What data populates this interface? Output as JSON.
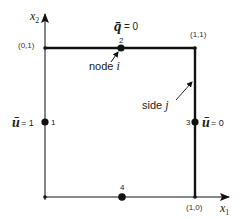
{
  "diagram": {
    "type": "unit square domain with boundary conditions",
    "axes": {
      "x1": {
        "label_main": "x",
        "label_sub": "1"
      },
      "x2": {
        "label_main": "x",
        "label_sub": "2"
      }
    },
    "corners": {
      "top_left": "(0,1)",
      "top_right": "(1,1)",
      "bottom_right": "(1,0)"
    },
    "nodes": [
      {
        "id": "1",
        "label": "1"
      },
      {
        "id": "2",
        "label": "2"
      },
      {
        "id": "3",
        "label": "3"
      },
      {
        "id": "4",
        "label": "4"
      }
    ],
    "boundary_conditions": {
      "top": {
        "symbol": "q̄",
        "eq": "= 0"
      },
      "left": {
        "symbol": "ū",
        "eq": "= 1"
      },
      "right": {
        "symbol": "ū",
        "eq": "= 0"
      }
    },
    "annotations": {
      "node_i": {
        "text": "node ",
        "var": "i"
      },
      "side_j": {
        "text": "side ",
        "var": "j"
      }
    },
    "colors": {
      "stroke": "#111111",
      "background": "#ffffff"
    }
  }
}
